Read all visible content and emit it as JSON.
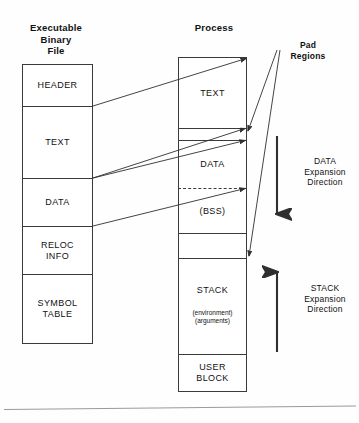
{
  "columns": {
    "binary": {
      "caption": "Executable\nBinary\nFile",
      "caption_line1": "Executable",
      "caption_line2": "Binary",
      "caption_line3": "File",
      "segments": [
        {
          "id": "header",
          "label": "HEADER"
        },
        {
          "id": "text",
          "label": "TEXT"
        },
        {
          "id": "data",
          "label": "DATA"
        },
        {
          "id": "reloc",
          "label": "RELOC\nINFO",
          "label_line1": "RELOC",
          "label_line2": "INFO"
        },
        {
          "id": "symtab",
          "label": "SYMBOL\nTABLE",
          "label_line1": "SYMBOL",
          "label_line2": "TABLE"
        }
      ]
    },
    "process": {
      "caption": "Process",
      "segments": [
        {
          "id": "text",
          "label": "TEXT"
        },
        {
          "id": "pad1",
          "label": ""
        },
        {
          "id": "data",
          "label": "DATA"
        },
        {
          "id": "bss",
          "label": "(BSS)"
        },
        {
          "id": "pad2",
          "label": ""
        },
        {
          "id": "stack",
          "label": "STACK",
          "sub_line1": "(environment)",
          "sub_line2": "(arguments)"
        },
        {
          "id": "user",
          "label": "USER\nBLOCK",
          "label_line1": "USER",
          "label_line2": "BLOCK"
        }
      ]
    }
  },
  "annotations": {
    "pad_regions": {
      "line1": "Pad",
      "line2": "Regions"
    },
    "data_expansion": {
      "line1": "DATA",
      "line2": "Expansion",
      "line3": "Direction",
      "arrow_direction": "down"
    },
    "stack_expansion": {
      "line1": "STACK",
      "line2": "Expansion",
      "line3": "Direction",
      "arrow_direction": "up"
    }
  },
  "colors": {
    "stroke": "#3a3a3a",
    "text": "#111111",
    "background": "#fefefe",
    "rule": "#9a9a9a"
  }
}
